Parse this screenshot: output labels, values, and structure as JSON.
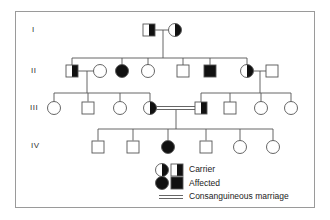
{
  "figure": {
    "type": "pedigree",
    "generations": [
      {
        "label": "I",
        "individuals": [
          {
            "id": "I-1",
            "sex": "male",
            "status": "carrier"
          },
          {
            "id": "I-2",
            "sex": "female",
            "status": "carrier"
          }
        ]
      },
      {
        "label": "II",
        "individuals": [
          {
            "id": "II-1",
            "sex": "male",
            "status": "carrier"
          },
          {
            "id": "II-1s",
            "sex": "female",
            "status": "unaffected",
            "spouse": true
          },
          {
            "id": "II-2",
            "sex": "female",
            "status": "affected"
          },
          {
            "id": "II-3",
            "sex": "female",
            "status": "unaffected"
          },
          {
            "id": "II-4",
            "sex": "male",
            "status": "unaffected"
          },
          {
            "id": "II-5",
            "sex": "male",
            "status": "affected"
          },
          {
            "id": "II-6",
            "sex": "female",
            "status": "carrier"
          },
          {
            "id": "II-6s",
            "sex": "male",
            "status": "unaffected",
            "spouse": true
          }
        ]
      },
      {
        "label": "III",
        "individuals": [
          {
            "id": "III-1",
            "sex": "female",
            "status": "unaffected"
          },
          {
            "id": "III-2",
            "sex": "male",
            "status": "unaffected"
          },
          {
            "id": "III-3",
            "sex": "female",
            "status": "unaffected"
          },
          {
            "id": "III-4",
            "sex": "female",
            "status": "carrier"
          },
          {
            "id": "III-5",
            "sex": "male",
            "status": "carrier"
          },
          {
            "id": "III-6",
            "sex": "male",
            "status": "unaffected"
          },
          {
            "id": "III-7",
            "sex": "female",
            "status": "unaffected"
          },
          {
            "id": "III-8",
            "sex": "female",
            "status": "unaffected"
          }
        ]
      },
      {
        "label": "IV",
        "individuals": [
          {
            "id": "IV-1",
            "sex": "male",
            "status": "unaffected"
          },
          {
            "id": "IV-2",
            "sex": "male",
            "status": "unaffected"
          },
          {
            "id": "IV-3",
            "sex": "female",
            "status": "affected"
          },
          {
            "id": "IV-4",
            "sex": "male",
            "status": "unaffected"
          },
          {
            "id": "IV-5",
            "sex": "female",
            "status": "unaffected"
          },
          {
            "id": "IV-6",
            "sex": "female",
            "status": "unaffected"
          }
        ]
      }
    ],
    "matings": [
      {
        "partners": [
          "I-1",
          "I-2"
        ],
        "consanguineous": false,
        "children": [
          "II-1",
          "II-2",
          "II-3",
          "II-4",
          "II-5",
          "II-6"
        ]
      },
      {
        "partners": [
          "II-1",
          "II-1s"
        ],
        "consanguineous": false,
        "children": [
          "III-1",
          "III-2",
          "III-3",
          "III-4"
        ]
      },
      {
        "partners": [
          "II-6",
          "II-6s"
        ],
        "consanguineous": false,
        "children": [
          "III-5",
          "III-6",
          "III-7",
          "III-8"
        ]
      },
      {
        "partners": [
          "III-4",
          "III-5"
        ],
        "consanguineous": true,
        "children": [
          "IV-1",
          "IV-2",
          "IV-3",
          "IV-4",
          "IV-5",
          "IV-6"
        ]
      }
    ]
  },
  "legend": {
    "carrier": "Carrier",
    "affected": "Affected",
    "consanguineous": "Consanguineous marriage"
  },
  "colors": {
    "line": "#555555",
    "fill": "#111111",
    "frame": "#9a9a9a"
  }
}
